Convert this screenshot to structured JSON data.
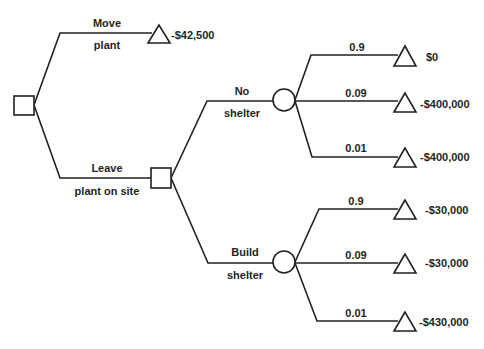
{
  "diagram": {
    "type": "decision-tree",
    "colors": {
      "stroke": "#231f20",
      "background": "#ffffff"
    },
    "root": {
      "kind": "decision",
      "shape": "square-icon"
    },
    "branches": {
      "move_plant": {
        "label_top": "Move",
        "label_bottom": "plant",
        "payoff": "-$42,500"
      },
      "leave_plant": {
        "label_top": "Leave",
        "label_bottom": "plant on site"
      }
    },
    "leave_decision": {
      "kind": "decision",
      "options": {
        "no_shelter": {
          "label_top": "No",
          "label_bottom": "shelter",
          "outcomes": [
            {
              "probability": "0.9",
              "payoff": "$0"
            },
            {
              "probability": "0.09",
              "payoff": "-$400,000"
            },
            {
              "probability": "0.01",
              "payoff": "-$400,000"
            }
          ]
        },
        "build_shelter": {
          "label_top": "Build",
          "label_bottom": "shelter",
          "outcomes": [
            {
              "probability": "0.9",
              "payoff": "-$30,000"
            },
            {
              "probability": "0.09",
              "payoff": "-$30,000"
            },
            {
              "probability": "0.01",
              "payoff": "-$430,000"
            }
          ]
        }
      }
    }
  }
}
